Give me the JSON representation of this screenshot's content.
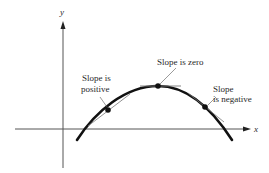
{
  "diagram": {
    "type": "slope-of-curve",
    "axes": {
      "x_label": "x",
      "y_label": "y"
    },
    "curve": {
      "shape": "downward parabola (concave down)"
    },
    "annotations": [
      {
        "id": "positive",
        "line1": "Slope is",
        "line2": "positive"
      },
      {
        "id": "zero",
        "line1": "Slope is zero"
      },
      {
        "id": "negative",
        "line1": "Slope",
        "line2": "is negative"
      }
    ],
    "colors": {
      "curve": "#111111",
      "axes": "#555555",
      "tangent": "#777777",
      "text": "#2a2a2a"
    }
  }
}
